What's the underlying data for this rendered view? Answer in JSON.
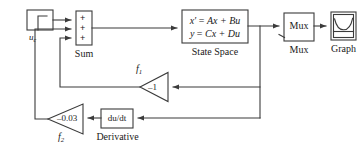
{
  "diagram": {
    "stroke_color": "#3b3b3b",
    "text_color": "#1a1a1a",
    "background": "#ffffff"
  },
  "blocks": {
    "source": {
      "label": "u",
      "label_sub": "c",
      "icon": "step-function-icon"
    },
    "sum": {
      "caption": "Sum",
      "signs": [
        "+",
        "+",
        "+"
      ]
    },
    "state_space": {
      "equation_line1_lhs": "x′",
      "equation_line1_eq": "=",
      "equation_line1_rhs": "Ax + Bu",
      "equation_line2_lhs": "y",
      "equation_line2_eq": "=",
      "equation_line2_rhs": "Cx + Du",
      "caption": "State Space"
    },
    "mux": {
      "label": "Mux",
      "caption": "Mux",
      "second_input_marker": ">"
    },
    "graph": {
      "caption": "Graph",
      "icon": "curve-plot-icon"
    },
    "gain_f1": {
      "value": "–1",
      "caption": "f",
      "caption_sub": "1"
    },
    "gain_f2": {
      "value": "–0.03",
      "caption": "f",
      "caption_sub": "2"
    },
    "derivative": {
      "label": "du/dt",
      "caption": "Derivative"
    }
  }
}
